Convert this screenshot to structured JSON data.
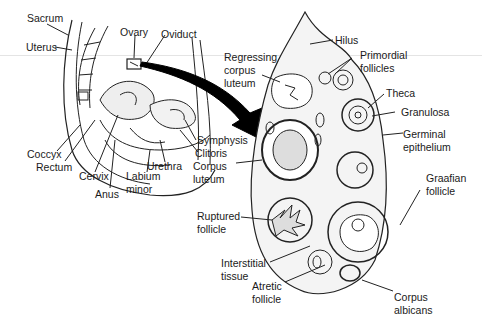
{
  "diagram": {
    "left_panel": {
      "subject": "Female pelvis sagittal section",
      "labels": {
        "sacrum": "Sacrum",
        "uterus": "Uterus",
        "ovary": "Ovary",
        "oviduct": "Oviduct",
        "coccyx": "Coccyx",
        "rectum": "Rectum",
        "cervix": "Cervix",
        "anus": "Anus",
        "labium_1": "Labium",
        "labium_2": "minor",
        "urethra": "Urethra",
        "symphysis": "Symphysis",
        "clitoris": "Clitoris"
      }
    },
    "arrow": {
      "icon": "curved-arrow-icon",
      "color": "#000000"
    },
    "right_panel": {
      "subject": "Ovary cross-section",
      "labels": {
        "hilus": "Hilus",
        "regressing_1": "Regressing",
        "regressing_2": "corpus",
        "regressing_3": "luteum",
        "primordial_1": "Primordial",
        "primordial_2": "follicles",
        "theca": "Theca",
        "granulosa": "Granulosa",
        "germinal_1": "Germinal",
        "germinal_2": "epithelium",
        "corpus_luteum_1": "Corpus",
        "corpus_luteum_2": "luteum",
        "graafian_1": "Graafian",
        "graafian_2": "follicle",
        "ruptured_1": "Ruptured",
        "ruptured_2": "follicle",
        "interstitial_1": "Interstitial",
        "interstitial_2": "tissue",
        "atretic_1": "Atretic",
        "atretic_2": "follicle",
        "albicans_1": "Corpus",
        "albicans_2": "albicans"
      }
    }
  }
}
